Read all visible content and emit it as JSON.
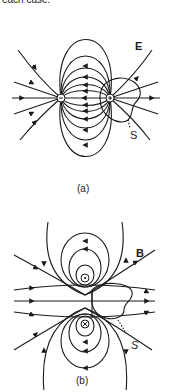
{
  "text": {
    "top_caption": "each case."
  },
  "figure_a": {
    "field_label": "E",
    "surface_label": "S",
    "caption": "(a)",
    "charges": [
      {
        "sign": "−",
        "x": 61,
        "y": 98
      },
      {
        "sign": "+",
        "x": 110,
        "y": 98
      }
    ]
  },
  "figure_b": {
    "field_label": "B",
    "surface_label": "S",
    "caption": "(b)",
    "currents": [
      {
        "symbol": "⊙",
        "direction": "out of page",
        "x": 85,
        "y": 278
      },
      {
        "symbol": "⊗",
        "direction": "into page",
        "x": 85,
        "y": 324
      }
    ]
  }
}
